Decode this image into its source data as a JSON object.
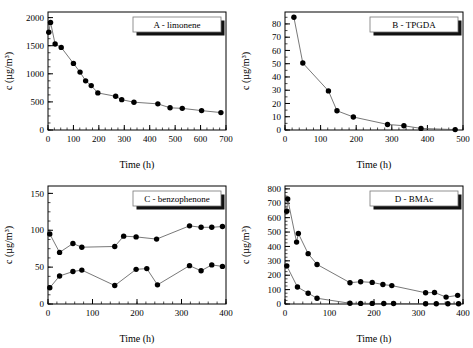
{
  "figure": {
    "background": "#ffffff",
    "marker_color": "#000000",
    "line_color": "#555555",
    "width": 473,
    "height": 348
  },
  "chart_data": [
    {
      "id": "panel-a",
      "type": "line",
      "title": "A  -  limonene",
      "xlabel": "Time (h)",
      "ylabel": "c (µg/m³)",
      "xlim": [
        0,
        700
      ],
      "ylim": [
        0,
        2100
      ],
      "xticks": [
        0,
        100,
        200,
        300,
        400,
        500,
        600,
        700
      ],
      "yticks": [
        0,
        500,
        1000,
        1500,
        2000
      ],
      "xminor_step": 25,
      "yminor_step": 125,
      "grid": false,
      "legend_position": "top-right",
      "series": [
        {
          "name": "limonene",
          "x": [
            3,
            10,
            28,
            52,
            100,
            126,
            148,
            170,
            196,
            266,
            290,
            338,
            432,
            480,
            528,
            604,
            680
          ],
          "y": [
            1740,
            1915,
            1530,
            1470,
            1185,
            1030,
            875,
            790,
            660,
            600,
            540,
            495,
            465,
            395,
            385,
            345,
            310
          ]
        }
      ]
    },
    {
      "id": "panel-b",
      "type": "line",
      "title": "B  -  TPGDA",
      "xlabel": "Time (h)",
      "ylabel": "c (µg/m³)",
      "xlim": [
        0,
        500
      ],
      "ylim": [
        0,
        89
      ],
      "xticks": [
        0,
        100,
        200,
        300,
        400,
        500
      ],
      "yticks": [
        0,
        10,
        20,
        30,
        40,
        50,
        60,
        70,
        80
      ],
      "xminor_step": 20,
      "yminor_step": 5,
      "grid": false,
      "legend_position": "top-right",
      "series": [
        {
          "name": "TPGDA",
          "x": [
            25,
            50,
            122,
            146,
            192,
            288,
            334,
            382,
            478
          ],
          "y": [
            85,
            50.5,
            29.5,
            14.5,
            9.8,
            4.2,
            3.2,
            1.2,
            0.3
          ]
        }
      ]
    },
    {
      "id": "panel-c",
      "type": "line",
      "title": "C  -  benzophenone",
      "xlabel": "Time (h)",
      "ylabel": "c (µg/m³)",
      "xlim": [
        0,
        400
      ],
      "ylim": [
        0,
        160
      ],
      "xticks": [
        0,
        100,
        200,
        300,
        400
      ],
      "yticks": [
        0,
        50,
        100,
        150
      ],
      "xminor_step": 20,
      "yminor_step": 12.5,
      "grid": false,
      "legend_position": "top-right",
      "series": [
        {
          "name": "benzophenone-upper",
          "x": [
            4,
            26,
            56,
            76,
            150,
            170,
            198,
            244,
            318,
            344,
            368,
            392
          ],
          "y": [
            95,
            70,
            82,
            77,
            78,
            92,
            91,
            88,
            106,
            104,
            104,
            105
          ]
        },
        {
          "name": "benzophenone-lower",
          "x": [
            4,
            26,
            56,
            76,
            150,
            198,
            222,
            246,
            318,
            344,
            368,
            392
          ],
          "y": [
            22,
            38,
            44,
            46,
            25,
            47,
            48,
            26,
            52,
            45,
            53,
            51
          ]
        }
      ]
    },
    {
      "id": "panel-d",
      "type": "line",
      "title": "D  -  BMAc",
      "xlabel": "Time (h)",
      "ylabel": "c (µg/m³)",
      "xlim": [
        0,
        400
      ],
      "ylim": [
        0,
        820
      ],
      "xticks": [
        0,
        100,
        200,
        300,
        400
      ],
      "yticks": [
        0,
        100,
        200,
        300,
        400,
        500,
        600,
        700,
        800
      ],
      "xminor_step": 20,
      "yminor_step": 25,
      "grid": false,
      "legend_position": "top-right",
      "series": [
        {
          "name": "BMAc-upper",
          "x": [
            4,
            6,
            26,
            30,
            52,
            72,
            146,
            170,
            196,
            220,
            240,
            316,
            336,
            362,
            388
          ],
          "y": [
            645,
            730,
            430,
            490,
            350,
            275,
            148,
            155,
            150,
            135,
            128,
            78,
            80,
            48,
            60
          ]
        },
        {
          "name": "BMAc-lower",
          "x": [
            4,
            28,
            52,
            72,
            146,
            170,
            196,
            222,
            244,
            316,
            340,
            366,
            390
          ],
          "y": [
            265,
            118,
            75,
            40,
            5,
            4,
            4,
            3,
            3,
            2,
            2,
            2,
            2
          ]
        }
      ]
    }
  ]
}
